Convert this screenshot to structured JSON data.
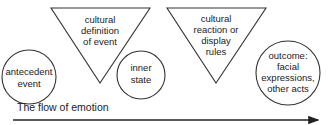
{
  "diagram": {
    "nodes": [
      {
        "id": "antecedent-event",
        "shape": "circle",
        "lines": [
          "antecedent",
          "event"
        ]
      },
      {
        "id": "cultural-definition",
        "shape": "triangle-down",
        "lines": [
          "cultural",
          "definition",
          "of event"
        ]
      },
      {
        "id": "inner-state",
        "shape": "circle",
        "lines": [
          "inner",
          "state"
        ]
      },
      {
        "id": "cultural-reaction",
        "shape": "triangle-down",
        "lines": [
          "cultural",
          "reaction or",
          "display",
          "rules"
        ]
      },
      {
        "id": "outcome",
        "shape": "circle",
        "lines": [
          "outcome:",
          "facial",
          "expressions,",
          "other acts"
        ]
      }
    ],
    "flow_label": "The flow of emotion",
    "colors": {
      "stroke": "#333333",
      "text": "#222222"
    }
  }
}
